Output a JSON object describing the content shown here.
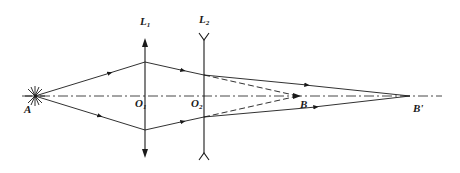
{
  "diagram": {
    "type": "optics-ray-diagram",
    "colors": {
      "line": "#1a1a1a",
      "background": "#ffffff"
    },
    "labels": {
      "source": "A",
      "lens1": {
        "base": "L",
        "sub": "1"
      },
      "lens2": {
        "base": "L",
        "sub": "2"
      },
      "center1": {
        "base": "O",
        "sub": "1"
      },
      "center2": {
        "base": "O",
        "sub": "2"
      },
      "image1": "B",
      "image2": "B'"
    },
    "elements": {
      "optical_axis": "dash-dot",
      "lens1_kind": "converging",
      "lens2_kind": "diverging",
      "virtual_rays": "dashed"
    }
  }
}
